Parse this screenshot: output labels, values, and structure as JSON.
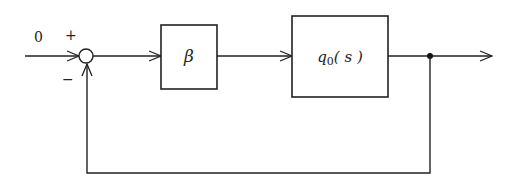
{
  "diagram": {
    "type": "block-diagram",
    "input_label": "0",
    "summing_junction": {
      "plus_sign": "+",
      "minus_sign": "−"
    },
    "blocks": [
      {
        "id": "gain",
        "label": "β"
      },
      {
        "id": "plant",
        "label_main": "q",
        "label_sub": "0",
        "label_arg": "( s )"
      }
    ],
    "feedback": "unity negative feedback from output to summing junction",
    "colors": {
      "line": "#222222",
      "background": "#ffffff"
    }
  }
}
